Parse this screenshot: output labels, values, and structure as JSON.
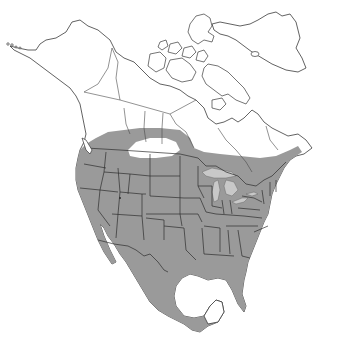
{
  "map": {
    "title": "",
    "region": "North America",
    "type": "species range map",
    "colors": {
      "background": "#ffffff",
      "land": "#ffffff",
      "outline": "#3a3a3a",
      "range_fill": "#9a9a9a",
      "lakes": "#c8c8c8",
      "excluded_area": "#ffffff"
    },
    "layers": [
      {
        "name": "land-outline",
        "description": "coastline of North America incl. Alaska, Canadian Arctic Archipelago, Greenland"
      },
      {
        "name": "political-borders",
        "description": "US state, Canadian province and Mexico boundaries"
      },
      {
        "name": "range",
        "description": "shaded distribution covering contiguous US, Mexico and southern Canada"
      },
      {
        "name": "range-gap",
        "description": "unshaded area in southern Alberta/Saskatchewan prairies"
      },
      {
        "name": "great-lakes",
        "description": "Great Lakes shown light gray"
      }
    ],
    "legend": []
  }
}
